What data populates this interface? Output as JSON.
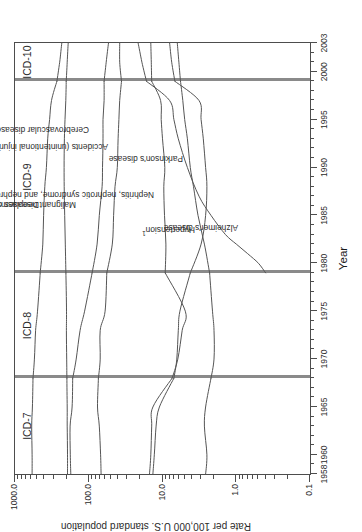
{
  "figure": {
    "title": "",
    "y_axis_title": "Rate per 100,000 U.S. standard population",
    "x_axis_title": "Year",
    "footnote_marker": "1"
  },
  "eras": [
    {
      "label": "ICD-7",
      "start": 1958,
      "end": 1968
    },
    {
      "label": "ICD-8",
      "start": 1968,
      "end": 1979
    },
    {
      "label": "ICD-9",
      "start": 1979,
      "end": 1999
    },
    {
      "label": "ICD-10",
      "start": 1999,
      "end": 2003
    }
  ],
  "chart_data": {
    "type": "line",
    "title": "",
    "xlabel": "Year",
    "ylabel": "Rate per 100,000 U.S. standard population",
    "xlim": [
      1958,
      2003
    ],
    "ylim": [
      0.1,
      1000.0
    ],
    "yscale": "log",
    "grid": false,
    "legend": "inline-labels",
    "xticks": [
      1958,
      1960,
      1965,
      1970,
      1975,
      1980,
      1985,
      1990,
      1995,
      2000,
      2003
    ],
    "xticklabels": [
      "1958",
      "1960",
      "1965",
      "1970",
      "1975",
      "1980",
      "1985",
      "1990",
      "1995",
      "2000",
      "2003"
    ],
    "yticks": [
      1000.0,
      100.0,
      10.0,
      1.0,
      0.1
    ],
    "yticklabels": [
      "1000.0",
      "100.0",
      "10.0",
      "1.0",
      "0.1"
    ],
    "annotations": [
      "Era panels separated by vertical rules at ICD revision changes (1968, 1979, 1999)"
    ],
    "series": [
      {
        "name": "Diseases of heart",
        "label": "Diseases of heart",
        "x": [
          1958,
          1960,
          1963,
          1965,
          1968,
          1970,
          1973,
          1975,
          1979,
          1982,
          1985,
          1988,
          1990,
          1993,
          1995,
          1997,
          1999,
          2001,
          2003
        ],
        "values": [
          587,
          586,
          594,
          580,
          570,
          545,
          525,
          495,
          455,
          420,
          410,
          395,
          375,
          360,
          340,
          320,
          270,
          248,
          232
        ]
      },
      {
        "name": "Malignant neoplasms",
        "label": "Malignant neoplasms",
        "x": [
          1958,
          1960,
          1963,
          1965,
          1968,
          1970,
          1973,
          1975,
          1979,
          1982,
          1985,
          1988,
          1990,
          1993,
          1995,
          1997,
          1999,
          2001,
          2003
        ],
        "values": [
          194,
          194,
          196,
          196,
          198,
          199,
          201,
          200,
          204,
          208,
          212,
          215,
          216,
          214,
          210,
          205,
          202,
          196,
          190
        ]
      },
      {
        "name": "Cerebrovascular diseases",
        "label": "Cerebrovascular diseases",
        "x": [
          1958,
          1960,
          1963,
          1965,
          1968,
          1970,
          1973,
          1975,
          1979,
          1982,
          1985,
          1988,
          1990,
          1993,
          1995,
          1997,
          1999,
          2001,
          2003
        ],
        "values": [
          175,
          178,
          179,
          168,
          165,
          148,
          131,
          114,
          90,
          77,
          72,
          66,
          65,
          64,
          64,
          62,
          62,
          58,
          54
        ]
      },
      {
        "name": "Accidents (unintentional injuries)",
        "label": "Accidents (unintentional injuries)",
        "x": [
          1958,
          1960,
          1963,
          1965,
          1968,
          1970,
          1973,
          1975,
          1979,
          1982,
          1985,
          1988,
          1990,
          1993,
          1995,
          1997,
          1999,
          2001,
          2003
        ],
        "values": [
          68,
          69,
          72,
          76,
          74,
          70,
          70,
          60,
          57,
          48,
          46,
          44,
          41,
          40,
          39,
          38,
          36,
          38,
          38
        ]
      },
      {
        "name": "Nephritis, nephrotic syndrome, and nephrosis",
        "label": "Nephritis, nephrotic syndrome, and nephrosis",
        "x": [
          1958,
          1960,
          1963,
          1965,
          1968,
          1970,
          1973,
          1975,
          1979,
          1982,
          1985,
          1988,
          1990,
          1993,
          1995,
          1997,
          1999,
          2001,
          2003
        ],
        "values": [
          15.0,
          14.4,
          14.0,
          13.5,
          7.4,
          6.2,
          5.4,
          4.9,
          9.2,
          9.0,
          9.4,
          9.6,
          9.3,
          10.0,
          10.4,
          10.6,
          14.0,
          14.2,
          14.4
        ]
      },
      {
        "name": "Hypertension",
        "label": "Hypertension",
        "label_superscript": "1",
        "x": [
          1958,
          1960,
          1963,
          1965,
          1968,
          1970,
          1973,
          1975,
          1979,
          1982,
          1985,
          1988,
          1990,
          1993,
          1995,
          1997,
          1999,
          2001,
          2003
        ],
        "values": [
          13.5,
          12.9,
          12.2,
          11.0,
          7.0,
          6.4,
          6.1,
          5.8,
          4.2,
          3.0,
          2.6,
          2.5,
          2.6,
          2.8,
          3.0,
          3.2,
          6.8,
          7.5,
          8.0
        ]
      },
      {
        "name": "Parkinson's disease",
        "label": "Parkinson's disease",
        "x": [
          1958,
          1960,
          1963,
          1965,
          1968,
          1970,
          1973,
          1975,
          1979,
          1982,
          1985,
          1988,
          1990,
          1993,
          1995,
          1997,
          1999,
          2001,
          2003
        ],
        "values": [
          2.6,
          2.5,
          2.7,
          2.6,
          2.2,
          2.0,
          2.0,
          2.1,
          2.3,
          2.7,
          3.3,
          3.8,
          4.2,
          4.6,
          5.0,
          5.3,
          5.7,
          6.0,
          6.3
        ]
      },
      {
        "name": "Alzheimer's disease",
        "label": "Alzheimer's disease",
        "x": [
          1979,
          1980,
          1981,
          1982,
          1983,
          1985,
          1987,
          1990,
          1993,
          1995,
          1997,
          1999,
          2001,
          2003
        ],
        "values": [
          0.4,
          0.5,
          0.7,
          1.0,
          1.4,
          2.2,
          3.2,
          4.6,
          6.1,
          7.0,
          8.0,
          16.5,
          19.0,
          21.4
        ]
      }
    ]
  },
  "series_labels": [
    {
      "text": "Diseases of heart"
    },
    {
      "text": "Malignant neoplasms"
    },
    {
      "text": "Cerebrovascular diseases"
    },
    {
      "text": "Accidents (unintentional injuries)"
    },
    {
      "text": "Nephritis, nephrotic syndrome, and nephrosis"
    },
    {
      "text": "Hypertension"
    },
    {
      "text": "Parkinson's disease"
    },
    {
      "text": "Alzheimer's disease"
    }
  ]
}
